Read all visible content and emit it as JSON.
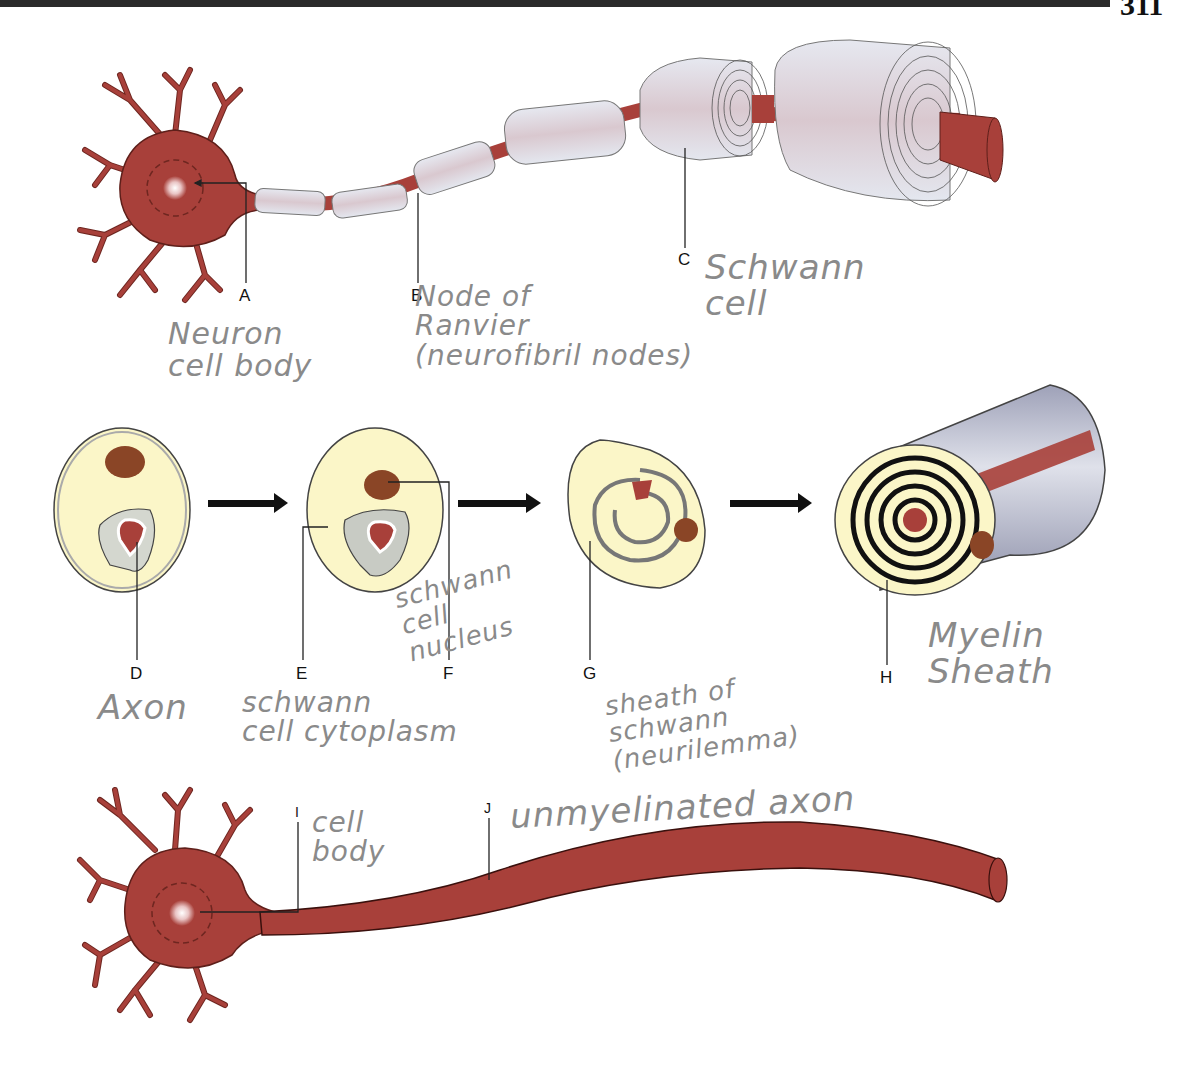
{
  "page": {
    "number": "311"
  },
  "colors": {
    "axon": "#a8403a",
    "schwann": "#dcdfe8",
    "cytoplasm": "#fbf6c8",
    "nucleus": "#8a4526",
    "leader": "#222222",
    "handwriting": "#8a8a8a"
  },
  "labels": {
    "A": {
      "letter": "A",
      "answer": "Neuron\ncell body"
    },
    "B": {
      "letter": "B",
      "answer": "Node of\nRanvier\n(neurofibril nodes)"
    },
    "C": {
      "letter": "C",
      "answer": "Schwann\ncell"
    },
    "D": {
      "letter": "D",
      "answer": "Axon"
    },
    "E": {
      "letter": "E",
      "answer": "schwann\ncell cytoplasm"
    },
    "F": {
      "letter": "F",
      "answer": "schwann\ncell\nnucleus"
    },
    "G": {
      "letter": "G",
      "answer": "sheath of\nschwann\n(neurilemma)"
    },
    "H": {
      "letter": "H",
      "answer": "Myelin\nSheath"
    },
    "I": {
      "letter": "I",
      "answer": "cell\nbody"
    },
    "J": {
      "letter": "J",
      "answer": "unmyelinated axon"
    }
  },
  "figures": {
    "top": "myelinated neuron",
    "middle": "myelin sheath formation stages",
    "bottom": "unmyelinated neuron"
  }
}
